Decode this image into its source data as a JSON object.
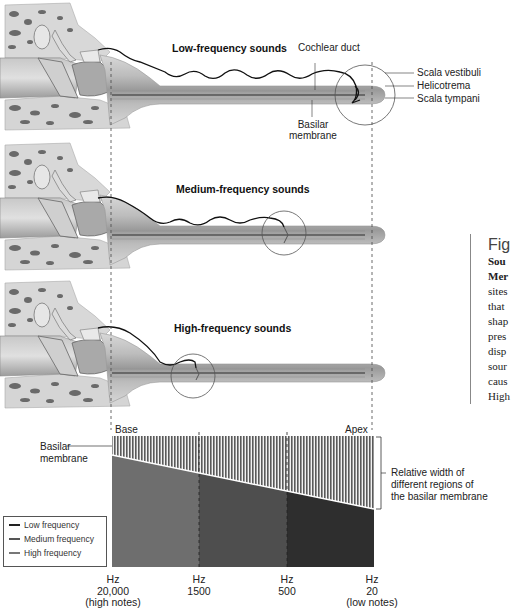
{
  "panels": [
    {
      "title": "Low-frequency sounds",
      "labels": {
        "cochlear_duct": "Cochlear duct",
        "scala_vestibuli": "Scala vestibuli",
        "helicotrema": "Helicotrema",
        "scala_tympani": "Scala tympani",
        "basilar_membrane_1": "Basilar",
        "basilar_membrane_2": "membrane"
      }
    },
    {
      "title": "Medium-frequency sounds"
    },
    {
      "title": "High-frequency sounds"
    }
  ],
  "figure_caption": {
    "heading": "Fig",
    "lines_bold": [
      "Sou",
      "Mer"
    ],
    "lines": [
      "sites",
      "that",
      "shap",
      "pres",
      "disp",
      "sour",
      "caus",
      "High",
      "wav",
      "clos"
    ]
  },
  "membrane_chart": {
    "base_label": "Base",
    "apex_label": "Apex",
    "basilar_label_1": "Basilar",
    "basilar_label_2": "membrane",
    "relative_width_1": "Relative width of",
    "relative_width_2": "different regions of",
    "relative_width_3": "the basilar membrane",
    "regions": [
      {
        "name": "High frequency",
        "color": "#6e6e6e"
      },
      {
        "name": "Medium frequency",
        "color": "#4e4e4e"
      },
      {
        "name": "Low frequency",
        "color": "#2e2e2e"
      }
    ],
    "hz_labels": [
      {
        "unit": "Hz",
        "value": "20,000",
        "note": "(high notes)"
      },
      {
        "unit": "Hz",
        "value": "1500",
        "note": ""
      },
      {
        "unit": "Hz",
        "value": "500",
        "note": ""
      },
      {
        "unit": "Hz",
        "value": "20",
        "note": "(low notes)"
      }
    ]
  },
  "legend": {
    "items": [
      {
        "label": "Low frequency",
        "color": "#222222"
      },
      {
        "label": "Medium frequency",
        "color": "#555555"
      },
      {
        "label": "High frequency",
        "color": "#777777"
      }
    ]
  }
}
